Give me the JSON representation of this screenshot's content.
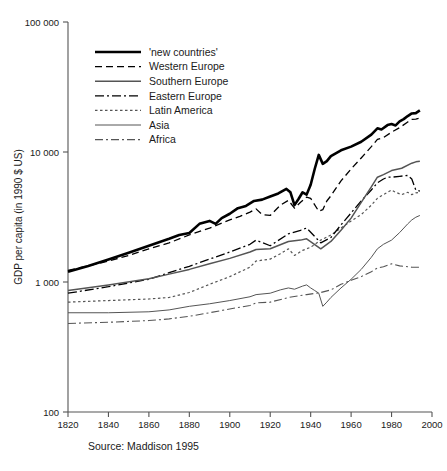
{
  "chart_data": {
    "type": "line",
    "title": "",
    "xlabel": "",
    "ylabel": "GDP per capita (in 1990 $ US)",
    "yscale": "log",
    "ylim": [
      100,
      100000
    ],
    "xlim": [
      1820,
      2000
    ],
    "grid": false,
    "legend_position": "top-left",
    "source_note": "Source: Maddison 1995",
    "xticks": [
      "1820",
      "1840",
      "1860",
      "1880",
      "1900",
      "1920",
      "1940",
      "1960",
      "1980",
      "2000"
    ],
    "xtick_values": [
      1820,
      1840,
      1860,
      1880,
      1900,
      1920,
      1940,
      1960,
      1980,
      2000
    ],
    "yticks": [
      "100",
      "1 000",
      "10 000",
      "100 000"
    ],
    "ytick_values": [
      100,
      1000,
      10000,
      100000
    ],
    "series": [
      {
        "name": "'new countries'",
        "style": "solid-thick",
        "color": "#000000",
        "width": 2.6,
        "dash": "none",
        "x": [
          1820,
          1830,
          1840,
          1850,
          1860,
          1870,
          1875,
          1880,
          1885,
          1890,
          1893,
          1896,
          1900,
          1904,
          1908,
          1912,
          1916,
          1920,
          1924,
          1928,
          1930,
          1932,
          1934,
          1936,
          1938,
          1940,
          1942,
          1944,
          1946,
          1948,
          1950,
          1955,
          1960,
          1965,
          1970,
          1973,
          1975,
          1978,
          1980,
          1982,
          1984,
          1986,
          1988,
          1990,
          1992,
          1994
        ],
        "y": [
          1200,
          1330,
          1490,
          1680,
          1900,
          2150,
          2300,
          2380,
          2800,
          2950,
          2800,
          3100,
          3350,
          3700,
          3850,
          4200,
          4300,
          4550,
          4800,
          5200,
          4900,
          3900,
          4350,
          4900,
          4700,
          5600,
          7400,
          9500,
          8100,
          8500,
          9300,
          10300,
          11000,
          12000,
          13600,
          15200,
          14900,
          16100,
          16400,
          16000,
          17200,
          17900,
          18900,
          19800,
          19900,
          20900
        ]
      },
      {
        "name": "Western Europe",
        "style": "dashed",
        "color": "#000000",
        "width": 1.3,
        "dash": "7,4",
        "x": [
          1820,
          1830,
          1840,
          1850,
          1860,
          1870,
          1880,
          1890,
          1900,
          1905,
          1910,
          1913,
          1916,
          1920,
          1925,
          1929,
          1932,
          1935,
          1938,
          1940,
          1944,
          1946,
          1948,
          1950,
          1955,
          1960,
          1965,
          1970,
          1973,
          1976,
          1980,
          1984,
          1988,
          1990,
          1992,
          1994
        ],
        "y": [
          1230,
          1330,
          1450,
          1600,
          1800,
          2000,
          2300,
          2600,
          3000,
          3200,
          3450,
          3650,
          3300,
          3250,
          3900,
          4250,
          3700,
          4100,
          4500,
          4400,
          3500,
          3600,
          4200,
          4600,
          6000,
          7400,
          9000,
          11000,
          12500,
          12900,
          14200,
          15400,
          17000,
          17800,
          17900,
          18200
        ]
      },
      {
        "name": "Southern Europe",
        "style": "solid-medium",
        "color": "#555555",
        "width": 1.5,
        "dash": "none",
        "x": [
          1820,
          1840,
          1860,
          1870,
          1880,
          1890,
          1900,
          1910,
          1913,
          1920,
          1929,
          1935,
          1938,
          1945,
          1950,
          1955,
          1960,
          1965,
          1970,
          1973,
          1976,
          1980,
          1985,
          1990,
          1992,
          1994
        ],
        "y": [
          860,
          950,
          1060,
          1150,
          1250,
          1380,
          1520,
          1700,
          1780,
          1800,
          2050,
          2100,
          2150,
          1800,
          2050,
          2500,
          3100,
          4100,
          5400,
          6400,
          6700,
          7200,
          7500,
          8200,
          8400,
          8500
        ]
      },
      {
        "name": "Eastern Europe",
        "style": "dash-dot",
        "color": "#000000",
        "width": 1.3,
        "dash": "9,3,2,3",
        "x": [
          1820,
          1840,
          1860,
          1870,
          1880,
          1890,
          1900,
          1910,
          1913,
          1920,
          1929,
          1935,
          1938,
          1945,
          1950,
          1955,
          1960,
          1965,
          1970,
          1973,
          1976,
          1978,
          1980,
          1984,
          1988,
          1990,
          1992,
          1994
        ],
        "y": [
          820,
          920,
          1050,
          1180,
          1320,
          1500,
          1700,
          1950,
          2100,
          1900,
          2350,
          2500,
          2600,
          2000,
          2200,
          2750,
          3400,
          4200,
          5100,
          5800,
          6200,
          6400,
          6400,
          6500,
          6600,
          6200,
          5100,
          5000
        ]
      },
      {
        "name": "Latin America",
        "style": "dotted",
        "color": "#555555",
        "width": 1.2,
        "dash": "2.5,2.5",
        "x": [
          1820,
          1840,
          1860,
          1870,
          1880,
          1890,
          1900,
          1910,
          1913,
          1920,
          1925,
          1929,
          1932,
          1936,
          1940,
          1945,
          1950,
          1955,
          1960,
          1965,
          1970,
          1973,
          1976,
          1980,
          1982,
          1985,
          1988,
          1990,
          1992,
          1994
        ],
        "y": [
          700,
          720,
          740,
          760,
          830,
          960,
          1100,
          1300,
          1450,
          1500,
          1650,
          1800,
          1600,
          1750,
          1850,
          2100,
          2300,
          2600,
          2950,
          3300,
          3900,
          4400,
          4700,
          5100,
          4900,
          4700,
          4900,
          4700,
          4850,
          4900
        ]
      },
      {
        "name": "Asia",
        "style": "solid-thin",
        "color": "#555555",
        "width": 1.0,
        "dash": "none",
        "x": [
          1820,
          1840,
          1860,
          1870,
          1880,
          1890,
          1900,
          1910,
          1913,
          1920,
          1925,
          1929,
          1932,
          1936,
          1938,
          1940,
          1942,
          1944,
          1946,
          1948,
          1950,
          1955,
          1960,
          1965,
          1970,
          1973,
          1976,
          1980,
          1984,
          1988,
          1990,
          1992,
          1994
        ],
        "y": [
          580,
          580,
          590,
          610,
          650,
          680,
          720,
          770,
          800,
          820,
          870,
          900,
          880,
          930,
          950,
          900,
          860,
          820,
          650,
          700,
          760,
          900,
          1050,
          1250,
          1550,
          1800,
          1950,
          2100,
          2400,
          2800,
          3000,
          3150,
          3250
        ]
      },
      {
        "name": "Africa",
        "style": "dash-dot-thin",
        "color": "#555555",
        "width": 1.1,
        "dash": "8,3,2,3",
        "x": [
          1820,
          1840,
          1860,
          1870,
          1880,
          1890,
          1900,
          1910,
          1913,
          1920,
          1929,
          1938,
          1945,
          1950,
          1955,
          1960,
          1965,
          1970,
          1973,
          1976,
          1980,
          1984,
          1988,
          1990,
          1992,
          1994
        ],
        "y": [
          480,
          490,
          505,
          520,
          545,
          580,
          620,
          660,
          690,
          700,
          760,
          800,
          830,
          870,
          960,
          1030,
          1100,
          1200,
          1280,
          1310,
          1380,
          1330,
          1310,
          1300,
          1300,
          1300
        ]
      }
    ]
  },
  "legend": {
    "items": [
      {
        "label": "'new countries'"
      },
      {
        "label": "Western Europe"
      },
      {
        "label": "Southern Europe"
      },
      {
        "label": "Eastern Europe"
      },
      {
        "label": "Latin America"
      },
      {
        "label": "Asia"
      },
      {
        "label": "Africa"
      }
    ]
  },
  "footer": {
    "source": "Source: Maddison 1995"
  }
}
